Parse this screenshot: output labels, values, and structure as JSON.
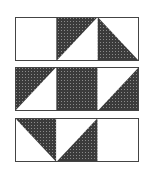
{
  "figure": {
    "colors": {
      "dark": "#3b3b3b",
      "dot": "#8a8a8a",
      "light": "#ffffff",
      "outline": "#444444"
    },
    "rows": [
      {
        "top": 17,
        "cells": [
          {
            "type": "blank"
          },
          {
            "type": "half",
            "dark": "upper-left"
          },
          {
            "type": "half",
            "dark": "lower-left"
          }
        ]
      },
      {
        "top": 67,
        "cells": [
          {
            "type": "half",
            "dark": "upper-left"
          },
          {
            "type": "full"
          },
          {
            "type": "half",
            "dark": "lower-right"
          }
        ]
      },
      {
        "top": 118,
        "cells": [
          {
            "type": "half",
            "dark": "upper-right"
          },
          {
            "type": "half",
            "dark": "lower-right"
          },
          {
            "type": "blank"
          }
        ]
      }
    ]
  }
}
